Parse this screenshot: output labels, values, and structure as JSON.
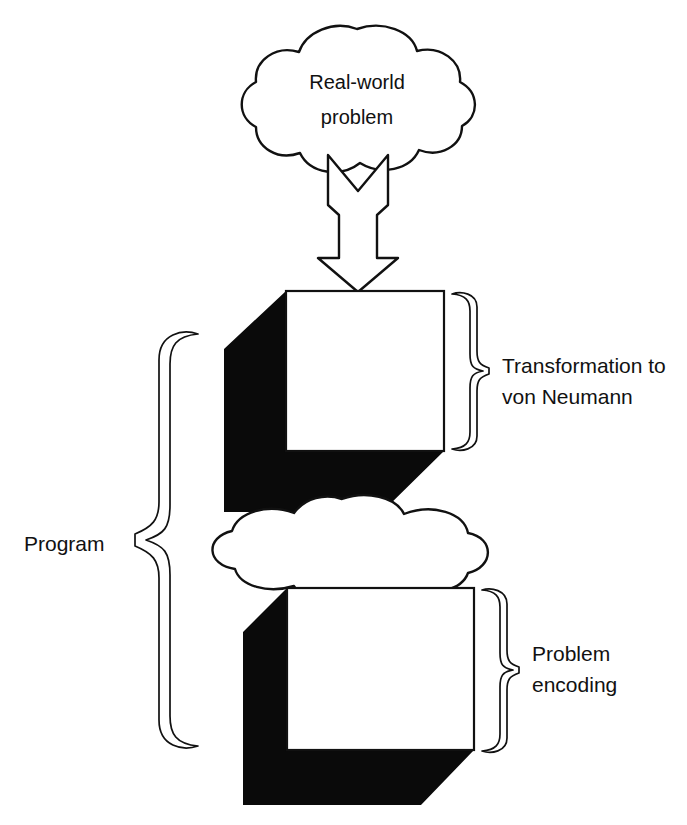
{
  "diagram": {
    "background_color": "#ffffff",
    "line_color": "#111111",
    "fill_black": "#0a0a0a",
    "fill_white": "#ffffff",
    "nodes": {
      "top_cloud": {
        "shape": "cloud",
        "line1": "Real-world",
        "line2": "problem"
      },
      "middle_cloud": {
        "shape": "cloud",
        "label": ""
      },
      "top_cube": {
        "shape": "cube",
        "label": ""
      },
      "bottom_cube": {
        "shape": "cube",
        "label": ""
      }
    },
    "connectors": {
      "down_arrow": {
        "shape": "hollow-block-arrow",
        "direction": "down"
      }
    },
    "annotations": {
      "right_top": {
        "brace": "right-curly-brace",
        "line1": "Transformation to",
        "line2": "von Neumann"
      },
      "right_bottom": {
        "brace": "right-curly-brace",
        "line1": "Problem",
        "line2": "encoding"
      },
      "left_program": {
        "brace": "left-curly-brace",
        "label": "Program"
      }
    }
  }
}
